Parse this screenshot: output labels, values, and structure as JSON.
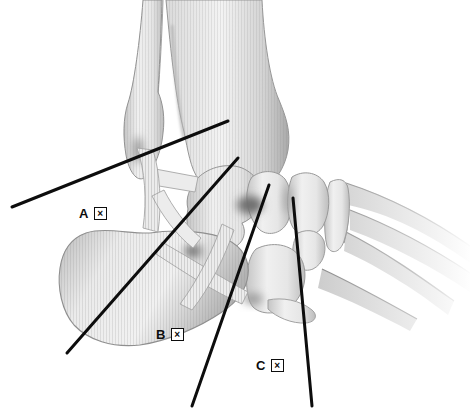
{
  "figure": {
    "background_color": "#ffffff",
    "ink_color": "#0d0d0d",
    "bone_light": "#f2f2f2",
    "bone_dark": "#b5b5b5",
    "width": 473,
    "height": 412
  },
  "labels": [
    {
      "letter": "A",
      "box_glyph": "×",
      "x": 79,
      "y": 207
    },
    {
      "letter": "B",
      "box_glyph": "×",
      "x": 156,
      "y": 328
    },
    {
      "letter": "C",
      "box_glyph": "×",
      "x": 256,
      "y": 359
    }
  ],
  "pointer_lines": [
    {
      "id": "pointer-line-1",
      "x1": 228,
      "y1": 121,
      "x2": 12,
      "y2": 207
    },
    {
      "id": "pointer-line-2",
      "x1": 238,
      "y1": 158,
      "x2": 67,
      "y2": 353
    },
    {
      "id": "pointer-line-3",
      "x1": 269,
      "y1": 185,
      "x2": 192,
      "y2": 406
    },
    {
      "id": "pointer-line-4",
      "x1": 293,
      "y1": 198,
      "x2": 312,
      "y2": 406
    }
  ]
}
